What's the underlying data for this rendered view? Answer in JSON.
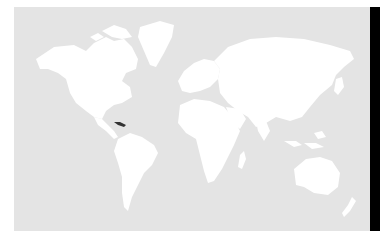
{
  "map": {
    "type": "world-choropleth",
    "ocean_color": "#e4e4e4",
    "land_color": "#ffffff",
    "highlight_color": "#333333",
    "highlighted_regions": [
      "Cuba"
    ]
  },
  "side_bar": {
    "color": "#000000"
  }
}
